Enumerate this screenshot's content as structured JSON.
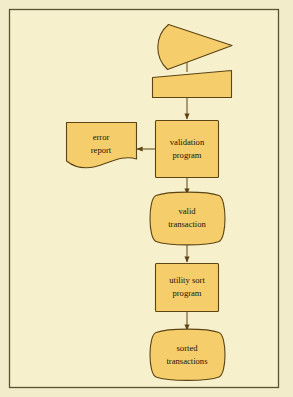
{
  "figure": {
    "page_background": "#f3eccb",
    "frame_background": "#f7f0cc",
    "frame_border_color": "#5a5233",
    "shape_fill": "#f5ce6b",
    "shape_stroke": "#5c4415",
    "text_color": "#1b1409",
    "connector_color": "#5c4415"
  },
  "nodes": [
    {
      "id": "input-deck",
      "type": "punched-card-deck",
      "label_line1": "",
      "label_line2": "",
      "interactable": false
    },
    {
      "id": "input-card",
      "type": "punched-card",
      "label_line1": "",
      "label_line2": "",
      "interactable": false
    },
    {
      "id": "validation-program",
      "type": "process",
      "label_line1": "validation",
      "label_line2": "program",
      "interactable": false
    },
    {
      "id": "error-report",
      "type": "document",
      "label_line1": "error",
      "label_line2": "report",
      "interactable": false
    },
    {
      "id": "valid-transaction",
      "type": "magnetic-tape",
      "label_line1": "valid",
      "label_line2": "transaction",
      "interactable": false
    },
    {
      "id": "utility-sort-program",
      "type": "process",
      "label_line1": "utility sort",
      "label_line2": "program",
      "interactable": false
    },
    {
      "id": "sorted-transactions",
      "type": "magnetic-tape",
      "label_line1": "sorted",
      "label_line2": "transactions",
      "interactable": false
    }
  ],
  "connectors": [
    {
      "id": "deck-to-card",
      "from": "input-deck",
      "to": "input-card",
      "direction": "down",
      "arrow": false
    },
    {
      "id": "card-to-validation",
      "from": "input-card",
      "to": "validation-program",
      "direction": "down",
      "arrow": true
    },
    {
      "id": "validation-to-error-report",
      "from": "validation-program",
      "to": "error-report",
      "direction": "left",
      "arrow": true
    },
    {
      "id": "validation-to-valid-transaction",
      "from": "validation-program",
      "to": "valid-transaction",
      "direction": "down",
      "arrow": true
    },
    {
      "id": "valid-transaction-to-sort",
      "from": "valid-transaction",
      "to": "utility-sort-program",
      "direction": "down",
      "arrow": true
    },
    {
      "id": "sort-to-sorted-transactions",
      "from": "utility-sort-program",
      "to": "sorted-transactions",
      "direction": "down",
      "arrow": true
    }
  ]
}
